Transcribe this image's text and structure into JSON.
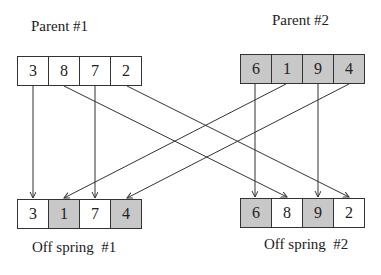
{
  "parent1": {
    "label": "Parent #1",
    "genes": [
      {
        "value": "3",
        "fill": "white"
      },
      {
        "value": "8",
        "fill": "white"
      },
      {
        "value": "7",
        "fill": "white"
      },
      {
        "value": "2",
        "fill": "white"
      }
    ]
  },
  "parent2": {
    "label": "Parent #2",
    "genes": [
      {
        "value": "6",
        "fill": "gray"
      },
      {
        "value": "1",
        "fill": "gray"
      },
      {
        "value": "9",
        "fill": "gray"
      },
      {
        "value": "4",
        "fill": "gray"
      }
    ]
  },
  "offspring1": {
    "label": "Off spring  #1",
    "genes": [
      {
        "value": "3",
        "fill": "white"
      },
      {
        "value": "1",
        "fill": "gray"
      },
      {
        "value": "7",
        "fill": "white"
      },
      {
        "value": "4",
        "fill": "gray"
      }
    ]
  },
  "offspring2": {
    "label": "Off spring  #2",
    "genes": [
      {
        "value": "6",
        "fill": "gray"
      },
      {
        "value": "8",
        "fill": "white"
      },
      {
        "value": "9",
        "fill": "gray"
      },
      {
        "value": "2",
        "fill": "white"
      }
    ]
  },
  "colors": {
    "parent2_fill": "#c8c8c8",
    "white_fill": "#ffffff",
    "line": "#333333"
  }
}
